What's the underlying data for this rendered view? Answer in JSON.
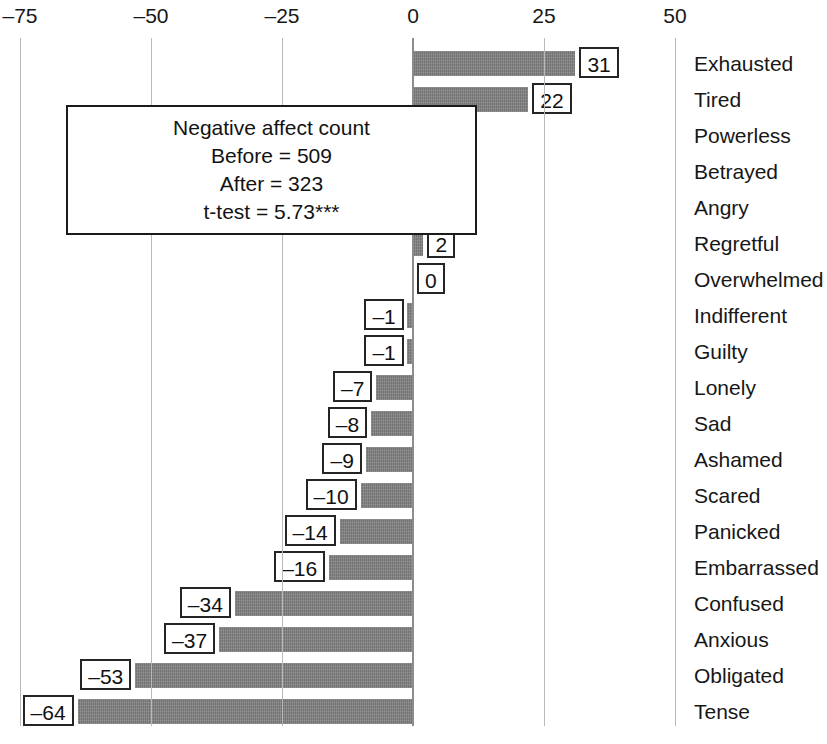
{
  "chart_data": {
    "type": "bar",
    "orientation": "horizontal",
    "title": "",
    "xlabel": "",
    "ylabel": "",
    "xlim": [
      -75,
      50
    ],
    "xticks": [
      -75,
      -50,
      -25,
      0,
      25,
      50
    ],
    "xtick_labels": [
      "–75",
      "–50",
      "–25",
      "0",
      "25",
      "50"
    ],
    "grid": true,
    "grid_axis": "x",
    "legend": "none",
    "bar_color": "#7d7d7d",
    "categories": [
      "Exhausted",
      "Tired",
      "Powerless",
      "Betrayed",
      "Angry",
      "Regretful",
      "Overwhelmed",
      "Indifferent",
      "Guilty",
      "Lonely",
      "Sad",
      "Ashamed",
      "Scared",
      "Panicked",
      "Embarrassed",
      "Confused",
      "Anxious",
      "Obligated",
      "Tense"
    ],
    "values": [
      31,
      22,
      5,
      4,
      4,
      2,
      0,
      -1,
      -1,
      -7,
      -8,
      -9,
      -10,
      -14,
      -16,
      -34,
      -37,
      -53,
      -64
    ],
    "value_labels": [
      "31",
      "22",
      "5",
      "4",
      "4",
      "2",
      "0",
      "–1",
      "–1",
      "–7",
      "–8",
      "–9",
      "–10",
      "–14",
      "–16",
      "–34",
      "–37",
      "–53",
      "–64"
    ],
    "annotation": {
      "lines": [
        "Negative affect count",
        "Before = 509",
        "After = 323",
        "t-test = 5.73***"
      ],
      "before": 509,
      "after": 323,
      "t_test": "5.73***"
    }
  }
}
